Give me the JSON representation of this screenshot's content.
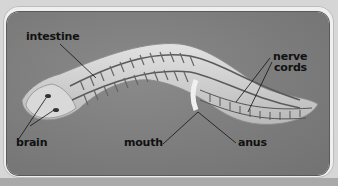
{
  "diagram": {
    "labels": {
      "intestine": "intestine",
      "nerve_cords_line1": "nerve",
      "nerve_cords_line2": "cords",
      "brain": "brain",
      "mouth": "mouth",
      "anus": "anus"
    },
    "colors": {
      "background": "#7b7b7b",
      "body": "#cfcfcf",
      "frame": "#efefef",
      "label_text": "#111111"
    }
  }
}
